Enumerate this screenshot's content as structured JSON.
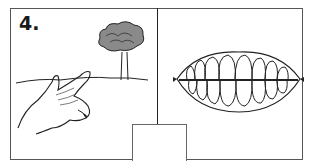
{
  "exercise": {
    "number_label": "4.",
    "left_panel": {
      "illustration": "hand-pointing-at-tree"
    },
    "right_panel": {
      "illustration": "teeth-smile"
    },
    "answer_box": {
      "value": ""
    }
  }
}
